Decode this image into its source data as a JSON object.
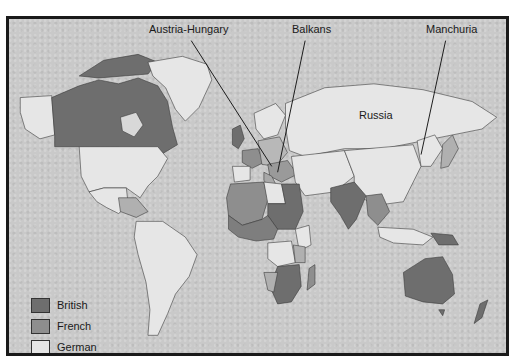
{
  "map": {
    "title": "",
    "colors": {
      "british": "#6e6e6e",
      "french": "#8e8e8e",
      "german": "#e6e6e6",
      "ocean": "#c9c9c9",
      "border": "#1a1a1a",
      "outline": "#3a3a3a"
    },
    "labels": {
      "austria_hungary": "Austria-Hungary",
      "balkans": "Balkans",
      "manchuria": "Manchuria",
      "russia": "Russia"
    },
    "legend": [
      {
        "key": "british",
        "label": "British"
      },
      {
        "key": "french",
        "label": "French"
      },
      {
        "key": "german",
        "label": "German"
      }
    ]
  }
}
